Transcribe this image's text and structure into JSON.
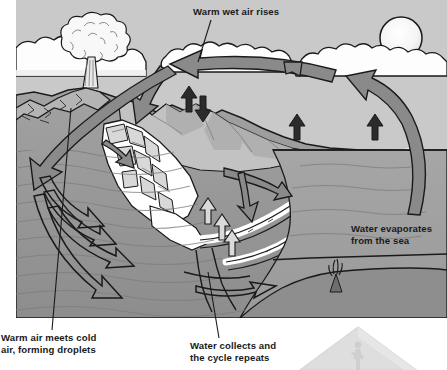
{
  "diagram": {
    "title_visible": false,
    "canvas": {
      "width": 447,
      "height": 370
    },
    "illustration_bounds": {
      "x": 16,
      "y": 0,
      "width": 431,
      "height": 318
    }
  },
  "labels": [
    {
      "id": "warm-wet-air-rises",
      "text": "Warm wet air rises",
      "lines": [
        "Warm wet air rises"
      ],
      "x": 193,
      "y": 6,
      "leader": {
        "from": [
          211,
          20
        ],
        "to": [
          198,
          62
        ]
      }
    },
    {
      "id": "water-evaporates-from-the-sea",
      "text": "Water evaporates from the sea",
      "lines": [
        "Water evaporates",
        "from the sea"
      ],
      "x": 351,
      "y": 223,
      "leader": null
    },
    {
      "id": "warm-air-meets-cold-air-forming-droplets",
      "text": "Warm air meets cold air, forming droplets",
      "lines": [
        "Warm air meets cold",
        "air, forming droplets"
      ],
      "x": 1,
      "y": 332,
      "leader": {
        "from": [
          52,
          330
        ],
        "to": [
          71,
          108
        ]
      }
    },
    {
      "id": "water-collects-and-the-cycle-repeats",
      "text": "Water collects and the cycle repeats",
      "lines": [
        "Water collects and",
        "the cycle repeats"
      ],
      "x": 190,
      "y": 340,
      "leader": {
        "from": [
          219,
          338
        ],
        "to": [
          208,
          272
        ]
      }
    }
  ],
  "scene_elements": [
    {
      "name": "sky",
      "kind": "background"
    },
    {
      "name": "sun",
      "kind": "celestial"
    },
    {
      "name": "cloud-bank",
      "kind": "cloud"
    },
    {
      "name": "volcano",
      "kind": "landform"
    },
    {
      "name": "eruption-plume",
      "kind": "cloud"
    },
    {
      "name": "mountain-range",
      "kind": "landform"
    },
    {
      "name": "glacier",
      "kind": "ice"
    },
    {
      "name": "river",
      "kind": "water"
    },
    {
      "name": "sea",
      "kind": "water"
    },
    {
      "name": "seabed",
      "kind": "landform"
    },
    {
      "name": "hydrothermal-vent",
      "kind": "landform"
    },
    {
      "name": "groundwater",
      "kind": "water"
    },
    {
      "name": "corner-mountain-badge",
      "kind": "decoration"
    }
  ],
  "arrows": [
    {
      "name": "arrow-air-transport-left",
      "direction": "left",
      "style": "filled",
      "meaning": "warm wet air moves inland"
    },
    {
      "name": "arrow-evaporation-sea",
      "direction": "up-left",
      "style": "filled",
      "meaning": "water evaporates from the sea"
    },
    {
      "name": "arrow-descending-precipitation",
      "direction": "down",
      "style": "filled",
      "meaning": "cooled air descends"
    },
    {
      "name": "arrow-precipitation-mountains",
      "direction": "down-left",
      "style": "filled",
      "meaning": "rain and snow fall on mountains"
    },
    {
      "name": "arrow-evaporation-land-1",
      "direction": "up",
      "style": "solid-dark",
      "meaning": "evaporation from land"
    },
    {
      "name": "arrow-evaporation-land-2",
      "direction": "up",
      "style": "solid-dark",
      "meaning": "evaporation from land"
    },
    {
      "name": "arrow-evaporation-land-3",
      "direction": "up",
      "style": "solid-dark",
      "meaning": "evaporation from land"
    },
    {
      "name": "arrow-precipitation-down",
      "direction": "down",
      "style": "solid-dark",
      "meaning": "precipitation"
    },
    {
      "name": "arrow-runoff-right",
      "direction": "right",
      "style": "filled",
      "meaning": "surface runoff to river"
    },
    {
      "name": "arrow-infiltration",
      "direction": "down",
      "style": "filled",
      "meaning": "water soaks into the ground"
    },
    {
      "name": "arrow-groundwater-1",
      "direction": "right",
      "style": "outline",
      "meaning": "groundwater flow"
    },
    {
      "name": "arrow-groundwater-2",
      "direction": "right",
      "style": "outline",
      "meaning": "groundwater flow"
    },
    {
      "name": "arrow-groundwater-3",
      "direction": "right",
      "style": "outline",
      "meaning": "groundwater flow"
    },
    {
      "name": "arrow-groundwater-deep",
      "direction": "right",
      "style": "outline",
      "meaning": "deep groundwater flow"
    },
    {
      "name": "arrow-groundwater-discharge",
      "direction": "right",
      "style": "outline",
      "meaning": "groundwater discharges to the sea"
    }
  ],
  "palette": {
    "sky": "#c9c9c9",
    "cloud": "#fdfdfd",
    "sun": "#f7f7f7",
    "outline": "#1a1a1a",
    "arrow_fill": "#8a8a8a",
    "arrow_fill_dark": "#2a2a2a",
    "land_light": "#c0c0c0",
    "land_mid": "#a8a8a8",
    "land_dark": "#8e8e8e",
    "sea": "#9d9d9d",
    "sea_deep": "#8a8a8a",
    "ice": "#ffffff",
    "label_text": "#1a1a1a",
    "page_background": "#ffffff"
  }
}
